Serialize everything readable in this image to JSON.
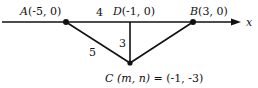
{
  "diagram": {
    "axis_label": "x",
    "points": {
      "A": {
        "label": "A",
        "coords": "(-5, 0)"
      },
      "D": {
        "label": "D",
        "coords": "(-1, 0)"
      },
      "B": {
        "label": "B",
        "coords": "(3, 0)"
      },
      "C": {
        "label": "C",
        "expr": "(m, n)",
        "equals": "= (-1, -3)"
      }
    },
    "segment_labels": {
      "AD": "4",
      "DC": "3",
      "AC": "5"
    },
    "colors": {
      "line": "#111111",
      "text": "#111111"
    }
  }
}
